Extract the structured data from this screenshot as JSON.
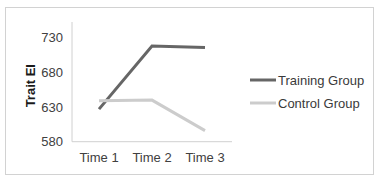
{
  "chart_data": {
    "type": "line",
    "title": "",
    "xlabel": "",
    "ylabel": "Trait EI",
    "categories": [
      "Time 1",
      "Time 2",
      "Time 3"
    ],
    "yticks": [
      580,
      630,
      680,
      730
    ],
    "ylim": [
      580,
      755
    ],
    "grid": false,
    "legend_position": "right",
    "series": [
      {
        "name": "Training Group",
        "color": "#666666",
        "values": [
          627,
          718,
          716
        ]
      },
      {
        "name": "Control Group",
        "color": "#cccccc",
        "values": [
          639,
          640,
          596
        ]
      }
    ]
  }
}
